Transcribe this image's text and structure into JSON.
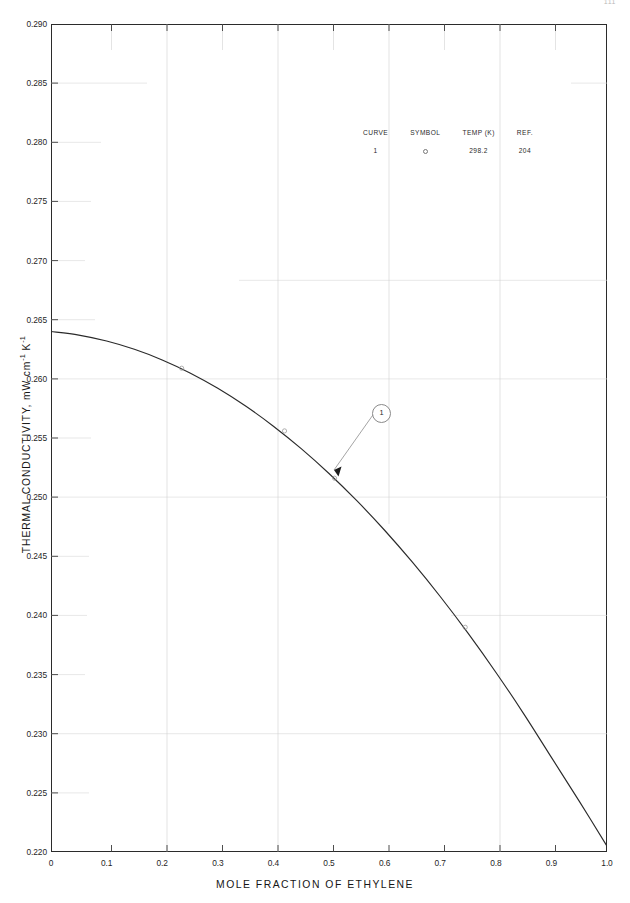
{
  "page": {
    "number": "111"
  },
  "axes": {
    "y_title_text": "THERMAL CONDUCTIVITY, mW cm",
    "y_title_sup1": "-1",
    "y_title_mid": " K",
    "y_title_sup2": "-1",
    "x_title": "MOLE FRACTION OF ETHYLENE"
  },
  "legend": {
    "headers": [
      "CURVE",
      "SYMBOL",
      "TEMP (K)",
      "REF."
    ],
    "rows": [
      {
        "curve": "1",
        "symbol": "circle-marker",
        "temp": "298.2",
        "ref": "204"
      }
    ]
  },
  "annotations": {
    "curve_label": "1"
  },
  "chart_data": {
    "type": "line",
    "title": "",
    "xlabel": "MOLE FRACTION OF ETHYLENE",
    "ylabel": "THERMAL CONDUCTIVITY, mW cm-1 K-1",
    "xlim": [
      0,
      1.0
    ],
    "ylim": [
      0.22,
      0.29
    ],
    "xticks": [
      "0",
      "0.1",
      "0.2",
      "0.3",
      "0.4",
      "0.5",
      "0.6",
      "0.7",
      "0.8",
      "0.9",
      "1.0"
    ],
    "xtick_values": [
      0,
      0.1,
      0.2,
      0.3,
      0.4,
      0.5,
      0.6,
      0.7,
      0.8,
      0.9,
      1.0
    ],
    "yticks": [
      "0.220",
      "0.225",
      "0.230",
      "0.235",
      "0.240",
      "0.245",
      "0.250",
      "0.255",
      "0.260",
      "0.265",
      "0.270",
      "0.275",
      "0.280",
      "0.285",
      "0.290"
    ],
    "ytick_values": [
      0.22,
      0.225,
      0.23,
      0.235,
      0.24,
      0.245,
      0.25,
      0.255,
      0.26,
      0.265,
      0.27,
      0.275,
      0.28,
      0.285,
      0.29
    ],
    "grid": true,
    "legend_position": "upper-center",
    "series": [
      {
        "name": "1",
        "temp_K": "298.2",
        "ref": "204",
        "x": [
          0.0,
          0.05,
          0.1,
          0.15,
          0.2,
          0.25,
          0.3,
          0.35,
          0.4,
          0.45,
          0.5,
          0.55,
          0.6,
          0.65,
          0.7,
          0.75,
          0.8,
          0.85,
          0.9,
          0.95,
          1.0
        ],
        "y": [
          0.264,
          0.2637,
          0.2632,
          0.2625,
          0.2616,
          0.2605,
          0.2592,
          0.2577,
          0.256,
          0.2541,
          0.252,
          0.2497,
          0.2472,
          0.2445,
          0.2416,
          0.2385,
          0.2352,
          0.2317,
          0.228,
          0.2243,
          0.2205
        ]
      }
    ],
    "markers": [
      {
        "x": 0.235,
        "y": 0.2609
      },
      {
        "x": 0.42,
        "y": 0.2556
      },
      {
        "x": 0.51,
        "y": 0.2516
      },
      {
        "x": 0.745,
        "y": 0.239
      }
    ]
  }
}
